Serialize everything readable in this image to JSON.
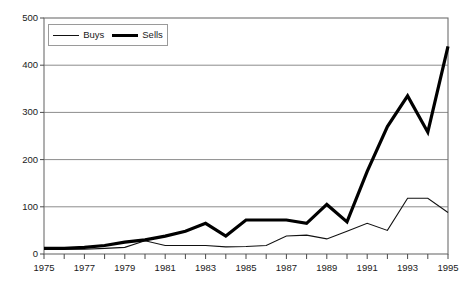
{
  "chart_data": {
    "type": "line",
    "title": "",
    "subtitle": "",
    "xlabel": "",
    "ylabel": "",
    "x": [
      1975,
      1976,
      1977,
      1978,
      1979,
      1980,
      1981,
      1982,
      1983,
      1984,
      1985,
      1986,
      1987,
      1988,
      1989,
      1990,
      1991,
      1992,
      1993,
      1994,
      1995
    ],
    "categories": [
      "1975",
      "1976",
      "1977",
      "1978",
      "1979",
      "1980",
      "1981",
      "1982",
      "1983",
      "1984",
      "1985",
      "1986",
      "1987",
      "1988",
      "1989",
      "1990",
      "1991",
      "1992",
      "1993",
      "1994",
      "1995"
    ],
    "series": [
      {
        "name": "Buys",
        "style": "thin",
        "color": "#111111",
        "values": [
          10,
          10,
          10,
          12,
          14,
          28,
          18,
          18,
          18,
          15,
          16,
          18,
          38,
          40,
          32,
          48,
          65,
          50,
          118,
          118,
          88
        ]
      },
      {
        "name": "Sells",
        "style": "thick",
        "color": "#000000",
        "values": [
          12,
          12,
          14,
          18,
          25,
          30,
          38,
          48,
          65,
          38,
          72,
          72,
          72,
          65,
          105,
          68,
          175,
          270,
          335,
          258,
          440
        ]
      }
    ],
    "xlim": [
      1975,
      1995
    ],
    "ylim": [
      0,
      500
    ],
    "yticks": [
      0,
      100,
      200,
      300,
      400,
      500
    ],
    "ytick_labels": [
      "0",
      "100",
      "200",
      "300",
      "400",
      "500"
    ],
    "xticks": [
      1975,
      1976,
      1977,
      1978,
      1979,
      1980,
      1981,
      1982,
      1983,
      1984,
      1985,
      1986,
      1987,
      1988,
      1989,
      1990,
      1991,
      1992,
      1993,
      1994,
      1995
    ],
    "xtick_labels_shown": [
      "1975",
      "1977",
      "1979",
      "1981",
      "1983",
      "1985",
      "1987",
      "1989",
      "1991",
      "1993",
      "1995"
    ],
    "grid": {
      "horizontal": true,
      "vertical": false,
      "color": "#8c8c8c"
    },
    "legend": {
      "position": "top-left-inside",
      "entries": [
        "Buys",
        "Sells"
      ]
    },
    "axes": {
      "frame_color": "#6e6e6e",
      "background": "#ffffff",
      "tick_marks": "outward-bottom"
    }
  }
}
